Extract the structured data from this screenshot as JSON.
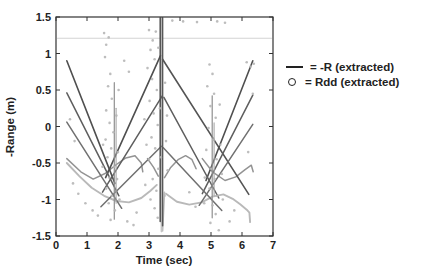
{
  "chart_data": {
    "type": "line",
    "title": "",
    "xlabel": "Time (sec)",
    "ylabel": "-Range (m)",
    "xlim": [
      0,
      7
    ],
    "ylim": [
      -1.5,
      1.5
    ],
    "grid": false,
    "legend_position": "outside-right",
    "x_tick_values": [
      0,
      1,
      2,
      3,
      4,
      5,
      6,
      7
    ],
    "x_tick_labels": [
      "0",
      "1",
      "2",
      "3",
      "4",
      "5",
      "6",
      "7"
    ],
    "y_tick_values": [
      1.5,
      1,
      0.5,
      0,
      -0.5,
      -1,
      -1.5
    ],
    "y_tick_labels": [
      "1.5",
      "1",
      "0.5",
      "0",
      "-0.5",
      "-1",
      "-1.5"
    ],
    "legend": [
      {
        "symbol": "line",
        "label": "= -R (extracted)"
      },
      {
        "symbol": "circle",
        "label": "= Rdd (extracted)"
      }
    ],
    "series": [
      {
        "name": "faint-horizontal-line",
        "color": "#d4d4d4",
        "width": 1.1,
        "points": [
          [
            0.05,
            1.21
          ],
          [
            6.95,
            1.21
          ]
        ]
      },
      {
        "name": "light-u-curve-left",
        "color": "#b9b9b9",
        "width": 1.9,
        "points": [
          [
            0.35,
            -0.5
          ],
          [
            0.75,
            -0.68
          ],
          [
            1.15,
            -0.84
          ],
          [
            1.55,
            -0.95
          ],
          [
            1.95,
            -1.02
          ],
          [
            2.35,
            -1.04
          ],
          [
            2.75,
            -0.98
          ],
          [
            3.05,
            -0.88
          ],
          [
            3.25,
            -0.8
          ]
        ]
      },
      {
        "name": "light-spike-center",
        "color": "#bdbdbd",
        "width": 1.6,
        "points": [
          [
            3.38,
            -0.8
          ],
          [
            3.44,
            -1.43
          ],
          [
            3.5,
            -0.9
          ]
        ]
      },
      {
        "name": "light-u-curve-right",
        "color": "#b9b9b9",
        "width": 1.9,
        "points": [
          [
            3.55,
            -0.92
          ],
          [
            3.9,
            -1.03
          ],
          [
            4.3,
            -1.07
          ],
          [
            4.7,
            -1.04
          ],
          [
            5.05,
            -0.96
          ],
          [
            5.4,
            -0.93
          ],
          [
            5.7,
            -0.99
          ],
          [
            5.95,
            -1.07
          ],
          [
            6.15,
            -1.14
          ],
          [
            6.24,
            -1.18
          ],
          [
            6.26,
            -1.31
          ]
        ]
      },
      {
        "name": "glitch-light-center",
        "color": "#c6c6c6",
        "width": 1.6,
        "points": [
          [
            3.4,
            1.49
          ],
          [
            3.4,
            -1.44
          ]
        ]
      },
      {
        "name": "cup-1",
        "color": "#939393",
        "width": 1.5,
        "points": [
          [
            0.35,
            -0.44
          ],
          [
            0.8,
            -0.62
          ],
          [
            1.2,
            -0.72
          ],
          [
            1.6,
            -0.64
          ],
          [
            1.95,
            -0.52
          ],
          [
            2.25,
            -0.43
          ],
          [
            2.55,
            -0.4
          ],
          [
            2.75,
            -0.5
          ],
          [
            2.8,
            -0.62
          ]
        ]
      },
      {
        "name": "cup-2-left",
        "color": "#939393",
        "width": 1.5,
        "points": [
          [
            2.95,
            -0.44
          ],
          [
            3.15,
            -0.56
          ],
          [
            3.3,
            -0.68
          ]
        ]
      },
      {
        "name": "cup-2-right",
        "color": "#939393",
        "width": 1.5,
        "points": [
          [
            3.5,
            -0.7
          ],
          [
            3.7,
            -0.56
          ],
          [
            3.95,
            -0.45
          ],
          [
            4.18,
            -0.4
          ],
          [
            4.38,
            -0.45
          ],
          [
            4.52,
            -0.58
          ]
        ]
      },
      {
        "name": "cup-3",
        "color": "#939393",
        "width": 1.5,
        "points": [
          [
            4.72,
            -0.44
          ],
          [
            5.05,
            -0.62
          ],
          [
            5.45,
            -0.74
          ],
          [
            5.8,
            -0.69
          ],
          [
            6.1,
            -0.59
          ],
          [
            6.3,
            -0.53
          ],
          [
            6.36,
            -0.62
          ]
        ]
      },
      {
        "name": "tent1-down-left",
        "color": "#4f4f4f",
        "width": 1.6,
        "points": [
          [
            0.35,
            0.9
          ],
          [
            1.9,
            -0.78
          ]
        ]
      },
      {
        "name": "tent1-up-center",
        "color": "#4f4f4f",
        "width": 1.6,
        "points": [
          [
            1.6,
            -0.7
          ],
          [
            3.37,
            0.97
          ]
        ]
      },
      {
        "name": "tent1-down-right-long",
        "color": "#545454",
        "width": 1.6,
        "points": [
          [
            3.44,
            0.92
          ],
          [
            6.22,
            -0.93
          ]
        ]
      },
      {
        "name": "tent1-up-right",
        "color": "#4f4f4f",
        "width": 1.6,
        "points": [
          [
            4.84,
            -0.74
          ],
          [
            6.35,
            0.9
          ]
        ]
      },
      {
        "name": "tent2-down-left",
        "color": "#5e5e5e",
        "width": 1.5,
        "points": [
          [
            0.35,
            0.46
          ],
          [
            2.03,
            -0.95
          ]
        ]
      },
      {
        "name": "tent2-up-center",
        "color": "#5e5e5e",
        "width": 1.5,
        "points": [
          [
            1.5,
            -0.9
          ],
          [
            3.43,
            0.42
          ]
        ]
      },
      {
        "name": "tent2-down-right",
        "color": "#5e5e5e",
        "width": 1.5,
        "points": [
          [
            3.48,
            0.4
          ],
          [
            5.25,
            -0.98
          ]
        ]
      },
      {
        "name": "tent2-up-right",
        "color": "#5e5e5e",
        "width": 1.5,
        "points": [
          [
            4.72,
            -0.92
          ],
          [
            6.35,
            0.43
          ]
        ]
      },
      {
        "name": "tent3-down-left",
        "color": "#707070",
        "width": 1.5,
        "points": [
          [
            0.35,
            0.06
          ],
          [
            2.12,
            -1.12
          ]
        ]
      },
      {
        "name": "tent3-up-center",
        "color": "#707070",
        "width": 1.5,
        "points": [
          [
            1.45,
            -1.1
          ],
          [
            3.4,
            -0.27
          ]
        ]
      },
      {
        "name": "tent3-down-right",
        "color": "#707070",
        "width": 1.5,
        "points": [
          [
            3.46,
            -0.29
          ],
          [
            5.35,
            -1.15
          ]
        ]
      },
      {
        "name": "tent3-up-right",
        "color": "#707070",
        "width": 1.5,
        "points": [
          [
            4.62,
            -1.08
          ],
          [
            6.35,
            0.03
          ]
        ]
      },
      {
        "name": "glitch-dark-1",
        "color": "#4f4f4f",
        "width": 1.5,
        "points": [
          [
            3.36,
            1.49
          ],
          [
            3.36,
            -1.3
          ]
        ]
      },
      {
        "name": "glitch-dark-2",
        "color": "#585858",
        "width": 1.5,
        "points": [
          [
            3.44,
            1.49
          ],
          [
            3.44,
            -1.36
          ]
        ]
      },
      {
        "name": "glitch-mid-left",
        "color": "#8f8f8f",
        "width": 1.2,
        "points": [
          [
            1.88,
            0.6
          ],
          [
            1.88,
            -1.27
          ]
        ]
      },
      {
        "name": "glitch-mid-left-2",
        "color": "#a8a8a8",
        "width": 1.1,
        "points": [
          [
            1.94,
            0.25
          ],
          [
            1.94,
            -1.05
          ]
        ]
      },
      {
        "name": "glitch-right",
        "color": "#8f8f8f",
        "width": 1.2,
        "points": [
          [
            5.04,
            0.42
          ],
          [
            5.04,
            -1.25
          ]
        ]
      },
      {
        "name": "glitch-right-2",
        "color": "#a8a8a8",
        "width": 1.1,
        "points": [
          [
            5.1,
            0.05
          ],
          [
            5.1,
            -0.95
          ]
        ]
      }
    ],
    "scatter": {
      "name": "Rdd (extracted)",
      "color": "#b6b6b6",
      "points": [
        [
          1.55,
          1.28
        ],
        [
          1.62,
          1.12
        ],
        [
          1.7,
          1.22
        ],
        [
          1.58,
          0.95
        ],
        [
          1.75,
          0.72
        ],
        [
          1.68,
          0.55
        ],
        [
          1.8,
          0.38
        ],
        [
          1.62,
          0.22
        ],
        [
          1.73,
          0.05
        ],
        [
          1.85,
          -0.08
        ],
        [
          1.6,
          -0.18
        ],
        [
          1.78,
          -0.3
        ],
        [
          1.66,
          -0.42
        ],
        [
          1.88,
          -0.55
        ],
        [
          1.72,
          -0.7
        ],
        [
          1.62,
          -0.85
        ],
        [
          1.8,
          -0.95
        ],
        [
          1.7,
          -1.05
        ],
        [
          1.9,
          -1.15
        ],
        [
          1.76,
          -1.28
        ],
        [
          1.95,
          0.15
        ],
        [
          2.0,
          -0.35
        ],
        [
          1.5,
          -0.55
        ],
        [
          1.97,
          -0.72
        ],
        [
          2.05,
          -1.0
        ],
        [
          1.52,
          -0.25
        ],
        [
          2.02,
          0.5
        ],
        [
          3.0,
          1.32
        ],
        [
          3.12,
          1.18
        ],
        [
          3.22,
          1.3
        ],
        [
          3.05,
          1.05
        ],
        [
          3.18,
          0.92
        ],
        [
          2.95,
          0.8
        ],
        [
          3.3,
          1.08
        ],
        [
          3.1,
          0.65
        ],
        [
          3.25,
          0.5
        ],
        [
          3.02,
          0.35
        ],
        [
          3.15,
          0.18
        ],
        [
          3.28,
          0.02
        ],
        [
          3.08,
          -0.15
        ],
        [
          3.2,
          -0.3
        ],
        [
          3.0,
          -0.45
        ],
        [
          3.3,
          -0.58
        ],
        [
          3.12,
          -0.72
        ],
        [
          3.24,
          -0.88
        ],
        [
          3.05,
          -1.0
        ],
        [
          3.18,
          -1.12
        ],
        [
          3.28,
          -1.25
        ],
        [
          2.92,
          -0.25
        ],
        [
          3.35,
          0.25
        ],
        [
          3.38,
          -0.42
        ],
        [
          3.52,
          0.6
        ],
        [
          3.55,
          -0.2
        ],
        [
          3.5,
          -0.95
        ],
        [
          3.58,
          0.15
        ],
        [
          3.6,
          -0.6
        ],
        [
          2.85,
          0.1
        ],
        [
          2.88,
          -0.8
        ],
        [
          4.95,
          0.85
        ],
        [
          5.05,
          0.72
        ],
        [
          4.88,
          0.55
        ],
        [
          5.1,
          0.45
        ],
        [
          4.98,
          0.28
        ],
        [
          5.15,
          0.12
        ],
        [
          4.92,
          -0.02
        ],
        [
          5.08,
          -0.18
        ],
        [
          4.85,
          -0.32
        ],
        [
          5.18,
          -0.45
        ],
        [
          5.0,
          -0.58
        ],
        [
          5.12,
          -0.72
        ],
        [
          4.95,
          -0.85
        ],
        [
          5.2,
          -0.95
        ],
        [
          5.05,
          -1.08
        ],
        [
          5.15,
          -1.2
        ],
        [
          4.98,
          -1.32
        ],
        [
          5.25,
          -1.42
        ],
        [
          5.3,
          -0.25
        ],
        [
          5.35,
          -0.65
        ],
        [
          4.8,
          -0.7
        ],
        [
          4.78,
          -1.05
        ],
        [
          5.28,
          0.3
        ],
        [
          5.38,
          -1.0
        ],
        [
          0.55,
          -0.78
        ],
        [
          0.72,
          -0.92
        ],
        [
          0.95,
          -1.05
        ],
        [
          1.18,
          -1.15
        ],
        [
          1.35,
          -1.22
        ],
        [
          2.3,
          -1.3
        ],
        [
          2.5,
          -1.35
        ],
        [
          2.6,
          -1.18
        ],
        [
          3.75,
          1.45
        ],
        [
          4.1,
          1.44
        ],
        [
          4.55,
          1.43
        ],
        [
          5.2,
          1.44
        ],
        [
          5.45,
          1.42
        ],
        [
          6.15,
          0.88
        ],
        [
          6.28,
          0.82
        ],
        [
          6.38,
          0.86
        ],
        [
          6.35,
          0.45
        ],
        [
          6.2,
          -0.35
        ],
        [
          2.2,
          0.9
        ],
        [
          2.35,
          0.75
        ],
        [
          4.3,
          -0.9
        ],
        [
          4.5,
          -1.1
        ],
        [
          5.6,
          -1.3
        ],
        [
          5.75,
          -1.15
        ],
        [
          0.45,
          0.1
        ],
        [
          0.6,
          -0.2
        ]
      ]
    }
  }
}
